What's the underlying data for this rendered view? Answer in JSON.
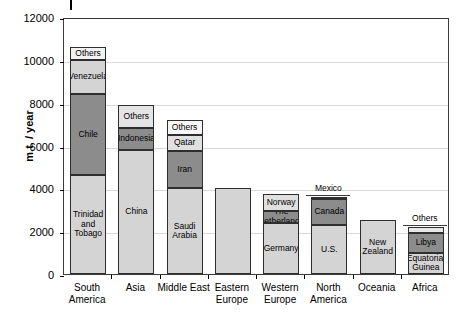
{
  "chart_data": {
    "type": "bar",
    "title": "",
    "subtitle": "",
    "xlabel": "",
    "ylabel": "m.t. / year",
    "ylim": [
      0,
      12000
    ],
    "ytick_values": [
      0,
      2000,
      4000,
      6000,
      8000,
      10000,
      12000
    ],
    "ytick_labels": [
      "0",
      "2000",
      "4000",
      "6000",
      "8000",
      "10000",
      "12000"
    ],
    "grid": true,
    "legend": "none",
    "stacked": true,
    "categories": [
      "South\nAmerica",
      "Asia",
      "Middle East",
      "Eastern\nEurope",
      "Western\nEurope",
      "North\nAmerica",
      "Oceania",
      "Africa"
    ],
    "bars": [
      {
        "category": "South\nAmerica",
        "total": 10600,
        "segments": [
          {
            "label": "Trinidad\nand\nTobago",
            "value": 4600,
            "y0": 0,
            "y1": 4600,
            "color": "#d4d4d4",
            "label_position": "inside"
          },
          {
            "label": "Chile",
            "value": 3800,
            "y0": 4600,
            "y1": 8400,
            "color": "#8c8c8c",
            "label_position": "inside"
          },
          {
            "label": "Venezuela",
            "value": 1600,
            "y0": 8400,
            "y1": 10000,
            "color": "#d4d4d4",
            "label_position": "inside"
          },
          {
            "label": "Others",
            "value": 600,
            "y0": 10000,
            "y1": 10600,
            "color": "#f2f2f2",
            "label_position": "inside"
          }
        ]
      },
      {
        "category": "Asia",
        "total": 7900,
        "segments": [
          {
            "label": "China",
            "value": 5800,
            "y0": 0,
            "y1": 5800,
            "color": "#d4d4d4",
            "label_position": "inside"
          },
          {
            "label": "Indonesia",
            "value": 1000,
            "y0": 5800,
            "y1": 6800,
            "color": "#8c8c8c",
            "label_position": "inside"
          },
          {
            "label": "Others",
            "value": 1100,
            "y0": 6800,
            "y1": 7900,
            "color": "#e4e4e4",
            "label_position": "inside"
          }
        ]
      },
      {
        "category": "Middle East",
        "total": 7200,
        "segments": [
          {
            "label": "Saudi\nArabia",
            "value": 4000,
            "y0": 0,
            "y1": 4000,
            "color": "#d4d4d4",
            "label_position": "inside"
          },
          {
            "label": "Iran",
            "value": 1750,
            "y0": 4000,
            "y1": 5750,
            "color": "#8c8c8c",
            "label_position": "inside"
          },
          {
            "label": "Qatar",
            "value": 750,
            "y0": 5750,
            "y1": 6500,
            "color": "#e0e0e0",
            "label_position": "inside"
          },
          {
            "label": "Others",
            "value": 700,
            "y0": 6500,
            "y1": 7200,
            "color": "#f7f7f7",
            "label_position": "inside"
          }
        ]
      },
      {
        "category": "Eastern\nEurope",
        "total": 4000,
        "segments": [
          {
            "label": "",
            "value": 4000,
            "y0": 0,
            "y1": 4000,
            "color": "#d4d4d4",
            "label_position": "none"
          }
        ]
      },
      {
        "category": "Western\nEurope",
        "total": 3750,
        "segments": [
          {
            "label": "Germany",
            "value": 2400,
            "y0": 0,
            "y1": 2400,
            "color": "#d4d4d4",
            "label_position": "inside"
          },
          {
            "label": "The\nNetherlands",
            "value": 550,
            "y0": 2400,
            "y1": 2950,
            "color": "#8c8c8c",
            "label_position": "inside"
          },
          {
            "label": "Norway",
            "value": 800,
            "y0": 2950,
            "y1": 3750,
            "color": "#e0e0e0",
            "label_position": "inside"
          }
        ]
      },
      {
        "category": "North\nAmerica",
        "total": 3600,
        "segments": [
          {
            "label": "U.S.",
            "value": 2300,
            "y0": 0,
            "y1": 2300,
            "color": "#d4d4d4",
            "label_position": "inside"
          },
          {
            "label": "Canada",
            "value": 1200,
            "y0": 2300,
            "y1": 3500,
            "color": "#8c8c8c",
            "label_position": "inside"
          },
          {
            "label": "Mexico",
            "value": 100,
            "y0": 3500,
            "y1": 3600,
            "color": "#b8b8b8",
            "label_position": "above"
          }
        ]
      },
      {
        "category": "Oceania",
        "total": 2500,
        "segments": [
          {
            "label": "New\nZealand",
            "value": 2500,
            "y0": 0,
            "y1": 2500,
            "color": "#d4d4d4",
            "label_position": "inside"
          }
        ]
      },
      {
        "category": "Africa",
        "total": 2200,
        "segments": [
          {
            "label": "Equatorial\nGuinea",
            "value": 1000,
            "y0": 0,
            "y1": 1000,
            "color": "#d4d4d4",
            "label_position": "inside"
          },
          {
            "label": "Libya",
            "value": 900,
            "y0": 1000,
            "y1": 1900,
            "color": "#8c8c8c",
            "label_position": "inside"
          },
          {
            "label": "Others",
            "value": 300,
            "y0": 1900,
            "y1": 2200,
            "color": "#e8e8e8",
            "label_position": "above"
          }
        ]
      }
    ],
    "colors": {
      "light_gray": "#d4d4d4",
      "dark_gray": "#8c8c8c",
      "near_white": "#f2f2f2",
      "axis": "#3a3a3a",
      "grid": "#d8d8d8",
      "text": "#000000"
    }
  }
}
